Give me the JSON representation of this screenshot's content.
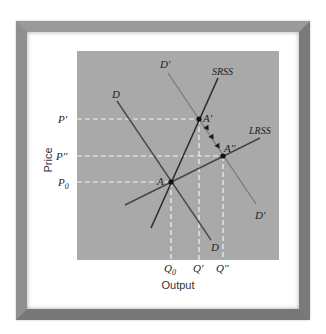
{
  "figure": {
    "type": "supply-demand-diagram",
    "background_color": "#a9a9a9",
    "frame_color": "#8a8a8a"
  },
  "axes": {
    "x_label": "Output",
    "y_label": "Price",
    "x_ticks": [
      {
        "label": "Q",
        "sub": "0",
        "sup": ""
      },
      {
        "label": "Q",
        "sub": "",
        "sup": "'"
      },
      {
        "label": "Q",
        "sub": "",
        "sup": "''"
      }
    ],
    "y_ticks": [
      {
        "label": "P",
        "sub": "",
        "sup": "'"
      },
      {
        "label": "P",
        "sub": "",
        "sup": "''"
      },
      {
        "label": "P",
        "sub": "0",
        "sup": ""
      }
    ]
  },
  "curves": {
    "demand": {
      "label_top": "D",
      "label_bottom": "D",
      "color": "#4a4a4a"
    },
    "demand_shifted": {
      "label_top": "D'",
      "label_bottom": "D'",
      "color": "#7a7a7a"
    },
    "srss": {
      "label": "SRSS",
      "color": "#2e2e2e"
    },
    "lrss": {
      "label": "LRSS",
      "color": "#454545"
    }
  },
  "points": {
    "A": "A",
    "A_prime": "A'",
    "A_double_prime": "A''"
  },
  "labels": {
    "p_prime": "P'",
    "p_double_prime": "P''",
    "p_zero_main": "P",
    "p_zero_sub": "0",
    "q_zero_main": "Q",
    "q_zero_sub": "0",
    "q_prime": "Q'",
    "q_double_prime": "Q''"
  }
}
